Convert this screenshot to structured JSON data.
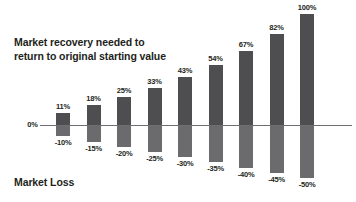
{
  "chart_data": {
    "type": "bar",
    "title": "Market recovery needed to\nreturn to original starting value",
    "xlabel": "Market Loss",
    "ylabel": "",
    "axis_zero_label": "0%",
    "grid": false,
    "legend": "none",
    "categories": [
      "-10%",
      "-15%",
      "-20%",
      "-25%",
      "-30%",
      "-35%",
      "-40%",
      "-45%",
      "-50%"
    ],
    "series": [
      {
        "name": "Market recovery needed",
        "labels": [
          "11%",
          "18%",
          "25%",
          "33%",
          "43%",
          "54%",
          "67%",
          "82%",
          "100%"
        ],
        "values": [
          11,
          18,
          25,
          33,
          43,
          54,
          67,
          82,
          100
        ]
      },
      {
        "name": "Market loss",
        "labels": [
          "-10%",
          "-15%",
          "-20%",
          "-25%",
          "-30%",
          "-35%",
          "-40%",
          "-45%",
          "-50%"
        ],
        "values": [
          -10,
          -15,
          -20,
          -25,
          -30,
          -35,
          -40,
          -45,
          -50
        ]
      }
    ],
    "ylim": [
      -50,
      100
    ],
    "colors": {
      "bar_above_zero": "#4e4e50",
      "bar_below_zero": "#6b6b6d",
      "axis_line": "#6f6f73",
      "text": "#231f20",
      "background": "#ffffff"
    }
  },
  "chart": {
    "title": "Market recovery needed to\nreturn to original starting value",
    "caption": "Market Loss",
    "zero_label": "0%"
  }
}
